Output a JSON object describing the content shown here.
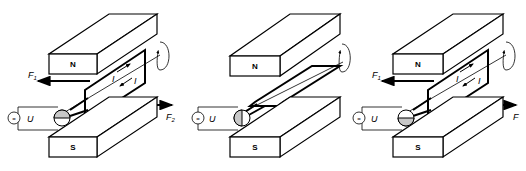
{
  "figure": {
    "panels": [
      {
        "id": "left",
        "north_label": "N",
        "south_label": "S",
        "voltage_label": "U",
        "source_symbol": "=",
        "current_labels": [
          "I",
          "I"
        ],
        "force_left": {
          "label": "F",
          "sub": "1"
        },
        "force_right": {
          "label": "F",
          "sub": "2"
        },
        "commutator_shading": "top"
      },
      {
        "id": "middle",
        "north_label": "N",
        "south_label": "S",
        "voltage_label": "U",
        "source_symbol": "=",
        "commutator_shading": "left"
      },
      {
        "id": "right",
        "north_label": "N",
        "south_label": "S",
        "voltage_label": "U",
        "source_symbol": "=",
        "current_labels": [
          "I",
          "I"
        ],
        "force_left": {
          "label": "F",
          "sub": "1"
        },
        "force_right": {
          "label": "F",
          "sub": ""
        },
        "commutator_shading": "bottom"
      }
    ],
    "colors": {
      "line": "#000000",
      "shading": "#c8c8c8",
      "background": "#ffffff"
    }
  }
}
